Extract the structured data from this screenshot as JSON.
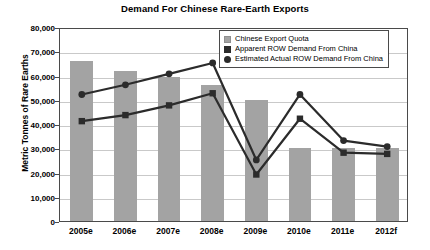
{
  "chart_data": {
    "type": "bar",
    "title": "Demand For Chinese Rare-Earth Exports",
    "xlabel": "",
    "ylabel": "Metric Tonnes of Rare Earths",
    "ylim": [
      0,
      80000
    ],
    "ytick_step": 10000,
    "ytick_labels": [
      "80,000",
      "70,000",
      "60,000",
      "50,000",
      "40,000",
      "30,000",
      "20,000",
      "10,000",
      "0"
    ],
    "ytick_values": [
      80000,
      70000,
      60000,
      50000,
      40000,
      30000,
      20000,
      10000,
      0
    ],
    "grid": true,
    "legend_position": "top-right",
    "categories": [
      "2005e",
      "2006e",
      "2007e",
      "2008e",
      "2009e",
      "2010e",
      "2011e",
      "2012f"
    ],
    "series": [
      {
        "name": "Chinese Export Quota",
        "type": "bar",
        "color": "#a3a3a3",
        "marker": "square-light",
        "values": [
          66000,
          62000,
          59500,
          56000,
          50000,
          30000,
          30000,
          30000
        ]
      },
      {
        "name": "Apparent ROW Demand From China",
        "type": "line",
        "color": "#2b2b2b",
        "marker": "square",
        "values": [
          42000,
          44500,
          48500,
          53500,
          20000,
          43000,
          29000,
          28500
        ]
      },
      {
        "name": "Estimated Actual ROW Demand From China",
        "type": "line",
        "color": "#2b2b2b",
        "marker": "circle",
        "values": [
          53000,
          57000,
          61500,
          66000,
          26000,
          53000,
          34000,
          31500
        ]
      }
    ]
  }
}
